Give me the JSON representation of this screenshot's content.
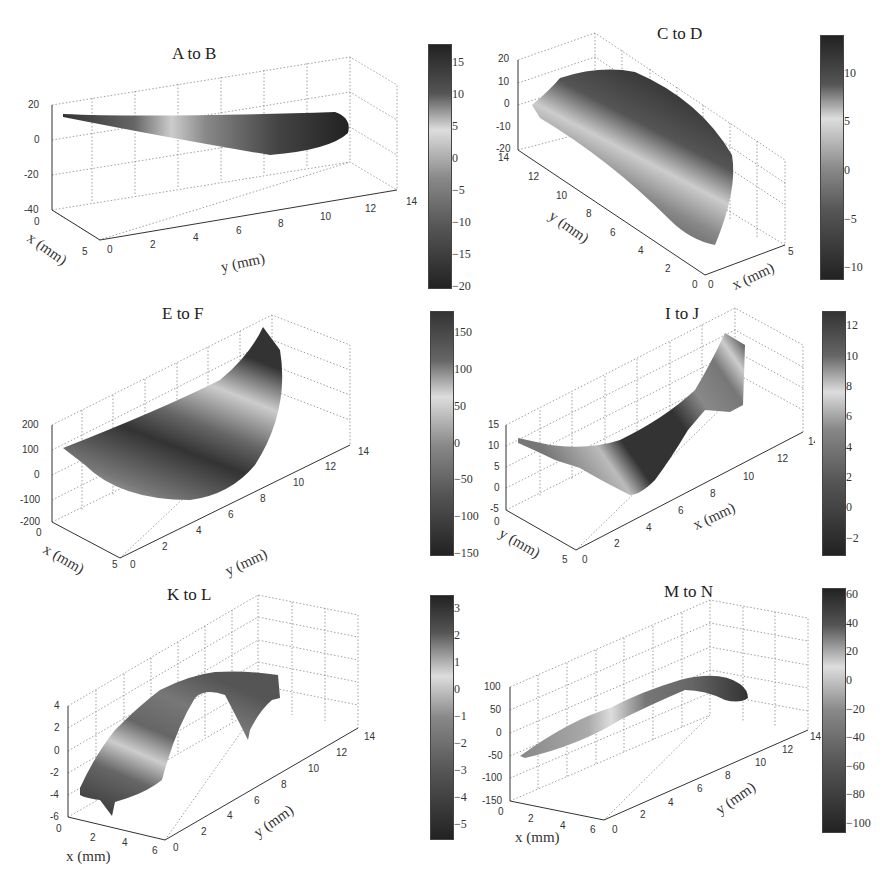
{
  "figure": {
    "partial_label_top_left": "(...)"
  },
  "chart_data": [
    {
      "type": "surface3d",
      "title": "A to B",
      "xlabel": "x (mm)",
      "ylabel": "y (mm)",
      "zlabel": "",
      "x_ticks": [
        "0",
        "5"
      ],
      "y_ticks": [
        "0",
        "2",
        "4",
        "6",
        "8",
        "10",
        "12",
        "14"
      ],
      "z_ticks": [
        "20",
        "0",
        "-20",
        "-40"
      ],
      "xlim": [
        0,
        5
      ],
      "ylim": [
        0,
        14
      ],
      "zlim": [
        -40,
        20
      ],
      "colorbar": {
        "ticks": [
          "15",
          "10",
          "5",
          "0",
          "-5",
          "-10",
          "-15",
          "-20"
        ],
        "range": [
          -20,
          18
        ]
      },
      "grid": true
    },
    {
      "type": "surface3d",
      "title": "C to D",
      "xlabel": "x (mm)",
      "ylabel": "y (mm)",
      "zlabel": "",
      "x_ticks": [
        "0",
        "5"
      ],
      "y_ticks": [
        "0",
        "2",
        "4",
        "6",
        "8",
        "10",
        "12",
        "14"
      ],
      "z_ticks": [
        "20",
        "10",
        "0",
        "-10",
        "-20"
      ],
      "xlim": [
        0,
        5
      ],
      "ylim": [
        0,
        14
      ],
      "zlim": [
        -20,
        20
      ],
      "colorbar": {
        "ticks": [
          "10",
          "5",
          "0",
          "-5",
          "-10"
        ],
        "range": [
          -11,
          14
        ]
      },
      "grid": true
    },
    {
      "type": "surface3d",
      "title": "E to F",
      "xlabel": "x (mm)",
      "ylabel": "y (mm)",
      "zlabel": "",
      "x_ticks": [
        "0",
        "5"
      ],
      "y_ticks": [
        "0",
        "2",
        "4",
        "6",
        "8",
        "10",
        "12",
        "14"
      ],
      "z_ticks": [
        "200",
        "100",
        "0",
        "-100",
        "-200"
      ],
      "xlim": [
        0,
        5
      ],
      "ylim": [
        0,
        14
      ],
      "zlim": [
        -200,
        200
      ],
      "colorbar": {
        "ticks": [
          "150",
          "100",
          "50",
          "0",
          "-50",
          "-100",
          "-150"
        ],
        "range": [
          -150,
          180
        ]
      },
      "grid": true
    },
    {
      "type": "surface3d",
      "title": "I to J",
      "xlabel": "x (mm)",
      "ylabel": "y (mm)",
      "zlabel": "",
      "x_ticks": [
        "0",
        "2",
        "4",
        "6",
        "8",
        "10",
        "12",
        "14"
      ],
      "y_ticks": [
        "0",
        "5"
      ],
      "z_ticks": [
        "15",
        "10",
        "5",
        "0",
        "-5"
      ],
      "xlim": [
        0,
        14
      ],
      "ylim": [
        0,
        5
      ],
      "zlim": [
        -5,
        15
      ],
      "colorbar": {
        "ticks": [
          "12",
          "10",
          "8",
          "6",
          "4",
          "2",
          "0",
          "-2"
        ],
        "range": [
          -3,
          13
        ]
      },
      "grid": true
    },
    {
      "type": "surface3d",
      "title": "K to L",
      "xlabel": "x (mm)",
      "ylabel": "y (mm)",
      "zlabel": "",
      "x_ticks": [
        "0",
        "2",
        "4",
        "6"
      ],
      "y_ticks": [
        "0",
        "2",
        "4",
        "6",
        "8",
        "10",
        "12",
        "14"
      ],
      "z_ticks": [
        "4",
        "2",
        "0",
        "-2",
        "-4",
        "-6"
      ],
      "xlim": [
        0,
        6
      ],
      "ylim": [
        0,
        14
      ],
      "zlim": [
        -6,
        4
      ],
      "colorbar": {
        "ticks": [
          "3",
          "2",
          "1",
          "0",
          "-1",
          "-2",
          "-3",
          "-4",
          "-5"
        ],
        "range": [
          -5.5,
          3.5
        ]
      },
      "grid": true
    },
    {
      "type": "surface3d",
      "title": "M to N",
      "xlabel": "x (mm)",
      "ylabel": "y (mm)",
      "zlabel": "",
      "x_ticks": [
        "0",
        "2",
        "4",
        "6"
      ],
      "y_ticks": [
        "0",
        "2",
        "4",
        "6",
        "8",
        "10",
        "12",
        "14"
      ],
      "z_ticks": [
        "100",
        "50",
        "0",
        "-50",
        "-100",
        "-150"
      ],
      "xlim": [
        0,
        6
      ],
      "ylim": [
        0,
        14
      ],
      "zlim": [
        -150,
        100
      ],
      "colorbar": {
        "ticks": [
          "60",
          "40",
          "20",
          "0",
          "-20",
          "-40",
          "-60",
          "-80",
          "-100"
        ],
        "range": [
          -105,
          65
        ]
      },
      "grid": true
    }
  ]
}
